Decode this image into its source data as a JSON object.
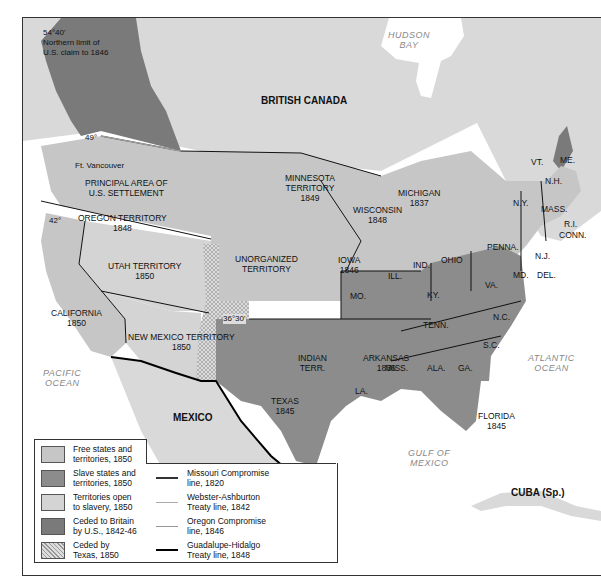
{
  "map": {
    "title": "",
    "colors": {
      "free": "#c6c6c6",
      "slave": "#8c8c8c",
      "open": "#d4d4d4",
      "ceded_britain": "#7a7a7a",
      "ceded_texas": "#d8d8d8",
      "foreign": "#d9d9d9",
      "water": "#ffffff",
      "border": "#111111"
    },
    "regions": {
      "british_canada": "BRITISH CANADA",
      "mexico": "MEXICO",
      "cuba": "CUBA (Sp.)",
      "hudson_bay": "HUDSON\nBAY",
      "pacific": "PACIFIC\nOCEAN",
      "atlantic": "ATLANTIC\nOCEAN",
      "gulf": "GULF OF\nMEXICO"
    },
    "annotations": {
      "northern_limit": "54°40'\nNorthern limit of\nU.S. claim to 1846",
      "lat49": "49°",
      "lat42": "42°",
      "lat3630": "36°30'",
      "ft_vancouver": "Ft. Vancouver",
      "principal_area": "PRINCIPAL AREA OF\nU.S. SETTLEMENT",
      "great_lakes": "Great Lakes",
      "st_lawrence": "St. Lawrence R.",
      "gila": "Gila R.",
      "rio_grande": "Rio Grande"
    },
    "territories": [
      {
        "id": "oregon",
        "name": "OREGON TERRITORY",
        "year": "1848",
        "status": "free"
      },
      {
        "id": "utah",
        "name": "UTAH TERRITORY",
        "year": "1850",
        "status": "open"
      },
      {
        "id": "california",
        "name": "CALIFORNIA",
        "year": "1850",
        "status": "free"
      },
      {
        "id": "new_mexico",
        "name": "NEW MEXICO TERRITORY",
        "year": "1850",
        "status": "open"
      },
      {
        "id": "unorganized",
        "name": "UNORGANIZED\nTERRITORY",
        "year": "",
        "status": "free"
      },
      {
        "id": "minnesota",
        "name": "MINNESOTA\nTERRITORY",
        "year": "1849",
        "status": "free"
      },
      {
        "id": "wisconsin",
        "name": "WISCONSIN",
        "year": "1848",
        "status": "free"
      },
      {
        "id": "michigan",
        "name": "MICHIGAN",
        "year": "1837",
        "status": "free"
      },
      {
        "id": "iowa",
        "name": "IOWA",
        "year": "1846",
        "status": "free"
      },
      {
        "id": "texas",
        "name": "TEXAS",
        "year": "1845",
        "status": "slave"
      },
      {
        "id": "indian",
        "name": "INDIAN\nTERR.",
        "year": "",
        "status": "slave"
      },
      {
        "id": "arkansas",
        "name": "ARKANSAS",
        "year": "1836",
        "status": "slave"
      },
      {
        "id": "florida",
        "name": "FLORIDA",
        "year": "1845",
        "status": "slave"
      },
      {
        "id": "ill",
        "name": "ILL.",
        "year": "",
        "status": "free"
      },
      {
        "id": "ind",
        "name": "IND.",
        "year": "",
        "status": "free"
      },
      {
        "id": "ohio",
        "name": "OHIO",
        "year": "",
        "status": "free"
      },
      {
        "id": "penna",
        "name": "PENNA.",
        "year": "",
        "status": "free"
      },
      {
        "id": "ny",
        "name": "N.Y.",
        "year": "",
        "status": "free"
      },
      {
        "id": "vt",
        "name": "VT.",
        "year": "",
        "status": "free"
      },
      {
        "id": "nh",
        "name": "N.H.",
        "year": "",
        "status": "free"
      },
      {
        "id": "me",
        "name": "ME.",
        "year": "",
        "status": "free"
      },
      {
        "id": "mass",
        "name": "MASS.",
        "year": "",
        "status": "free"
      },
      {
        "id": "ri",
        "name": "R.I.",
        "year": "",
        "status": "free"
      },
      {
        "id": "conn",
        "name": "CONN.",
        "year": "",
        "status": "free"
      },
      {
        "id": "nj",
        "name": "N.J.",
        "year": "",
        "status": "free"
      },
      {
        "id": "md",
        "name": "MD.",
        "year": "",
        "status": "slave"
      },
      {
        "id": "del",
        "name": "DEL.",
        "year": "",
        "status": "slave"
      },
      {
        "id": "mo",
        "name": "MO.",
        "year": "",
        "status": "slave"
      },
      {
        "id": "ky",
        "name": "KY.",
        "year": "",
        "status": "slave"
      },
      {
        "id": "va",
        "name": "VA.",
        "year": "",
        "status": "slave"
      },
      {
        "id": "tenn",
        "name": "TENN.",
        "year": "",
        "status": "slave"
      },
      {
        "id": "nc",
        "name": "N.C.",
        "year": "",
        "status": "slave"
      },
      {
        "id": "sc",
        "name": "S.C.",
        "year": "",
        "status": "slave"
      },
      {
        "id": "ga",
        "name": "GA.",
        "year": "",
        "status": "slave"
      },
      {
        "id": "ala",
        "name": "ALA.",
        "year": "",
        "status": "slave"
      },
      {
        "id": "miss",
        "name": "MISS.",
        "year": "",
        "status": "slave"
      },
      {
        "id": "la",
        "name": "LA.",
        "year": "",
        "status": "slave"
      }
    ]
  },
  "legend": {
    "areas": [
      {
        "label": "Free states and\nterritories, 1850",
        "color": "#c6c6c6"
      },
      {
        "label": "Slave states and\nterritories, 1850",
        "color": "#8c8c8c"
      },
      {
        "label": "Territories open\nto slavery, 1850",
        "color": "#d4d4d4"
      },
      {
        "label": "Ceded to Britain\nby U.S., 1842-46",
        "color": "#7a7a7a"
      },
      {
        "label": "Ceded by\nTexas, 1850",
        "color": "dotted"
      }
    ],
    "lines": [
      {
        "label": "Missouri Compromise\nline, 1820",
        "color": "#333333",
        "width": 2
      },
      {
        "label": "Webster-Ashburton\nTreaty line, 1842",
        "color": "#aaaaaa",
        "width": 1.5
      },
      {
        "label": "Oregon Compromise\nline, 1846",
        "color": "#999999",
        "width": 1.5
      },
      {
        "label": "Guadalupe-Hidalgo\nTreaty line, 1848",
        "color": "#000000",
        "width": 2.5
      }
    ]
  }
}
